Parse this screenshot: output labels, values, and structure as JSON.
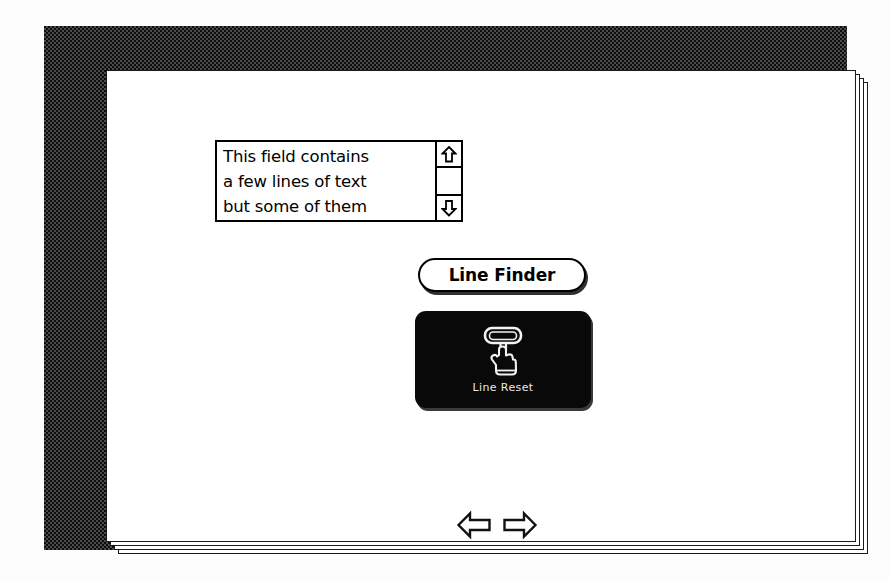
{
  "window": {
    "frame_style": "dithered-1bit-border",
    "border_color": "#0d0d0d",
    "card_background": "#ffffff",
    "stacked_window_count": 3
  },
  "text_field": {
    "name": "scrolling-text-field",
    "lines": [
      "This field contains",
      "a few lines of text",
      "but some of them"
    ],
    "scrollbar": {
      "up_arrow_icon": "scroll-up-arrow-icon",
      "down_arrow_icon": "scroll-down-arrow-icon",
      "thumb_visible": false
    }
  },
  "buttons": {
    "line_finder": {
      "label": "Line Finder",
      "style": "rounded-rect-pill",
      "has_shadow": true
    },
    "line_reset": {
      "label": "Line Reset",
      "style": "dark-icon-button",
      "background": "#090909",
      "text_color": "#e8e8e8",
      "icon": "hand-pressing-button-icon"
    }
  },
  "navigation": {
    "prev": {
      "icon": "left-arrow-icon",
      "label": "Previous card"
    },
    "next": {
      "icon": "right-arrow-icon",
      "label": "Next card"
    }
  }
}
